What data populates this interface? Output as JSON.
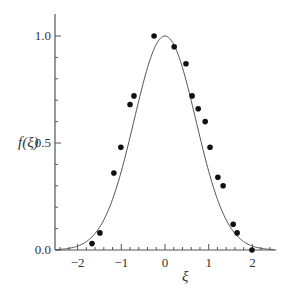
{
  "chart_data": {
    "type": "scatter",
    "title": "",
    "xlabel": "ξ",
    "ylabel": "f(ξ)",
    "xlim": [
      -2.5,
      2.5
    ],
    "ylim": [
      0.0,
      1.1
    ],
    "x_ticks": [
      -2,
      -1,
      0,
      1,
      2
    ],
    "x_tick_labels": [
      "−2",
      "−1",
      "0",
      "1",
      "2"
    ],
    "y_ticks": [
      0.0,
      0.5,
      1.0
    ],
    "y_tick_labels": [
      "0.0",
      "0.5",
      "1.0"
    ],
    "grid": false,
    "legend": null,
    "series": [
      {
        "name": "data",
        "kind": "scatter",
        "marker": "filled-circle",
        "x": [
          -1.67,
          -1.49,
          -1.17,
          -1.01,
          -0.8,
          -0.71,
          -0.25,
          0.21,
          0.48,
          0.62,
          0.76,
          0.92,
          1.03,
          1.21,
          1.33,
          1.56,
          1.65,
          1.99
        ],
        "y": [
          0.03,
          0.08,
          0.36,
          0.48,
          0.68,
          0.72,
          1.0,
          0.95,
          0.87,
          0.72,
          0.66,
          0.6,
          0.48,
          0.34,
          0.3,
          0.12,
          0.08,
          0.0
        ]
      },
      {
        "name": "fit",
        "kind": "line",
        "function": "exp(-xi^2)",
        "x_range": [
          -2.5,
          2.5
        ]
      }
    ]
  },
  "colors": {
    "axis": "#555555",
    "curve": "#555555",
    "points": "#111111"
  }
}
